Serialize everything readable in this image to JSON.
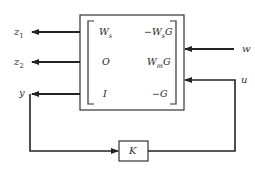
{
  "diagram": {
    "type": "block-diagram",
    "plant": {
      "matrix": [
        [
          {
            "base": "W",
            "sub": "s",
            "prefix": ""
          },
          {
            "base": "W",
            "sub": "s",
            "prefix": "−",
            "suffix": "G"
          }
        ],
        [
          {
            "base": "O",
            "sub": "",
            "prefix": ""
          },
          {
            "base": "W",
            "sub": "m",
            "prefix": "",
            "suffix": "G"
          }
        ],
        [
          {
            "base": "I",
            "sub": "",
            "prefix": ""
          },
          {
            "base": "G",
            "sub": "",
            "prefix": "−",
            "suffix": ""
          }
        ]
      ]
    },
    "controller": {
      "label": "K"
    },
    "outputs": [
      {
        "name": "z",
        "sub": "1"
      },
      {
        "name": "z",
        "sub": "2"
      },
      {
        "name": "y",
        "sub": ""
      }
    ],
    "inputs": [
      {
        "name": "w"
      },
      {
        "name": "u"
      }
    ],
    "stroke_color": "#222222"
  }
}
